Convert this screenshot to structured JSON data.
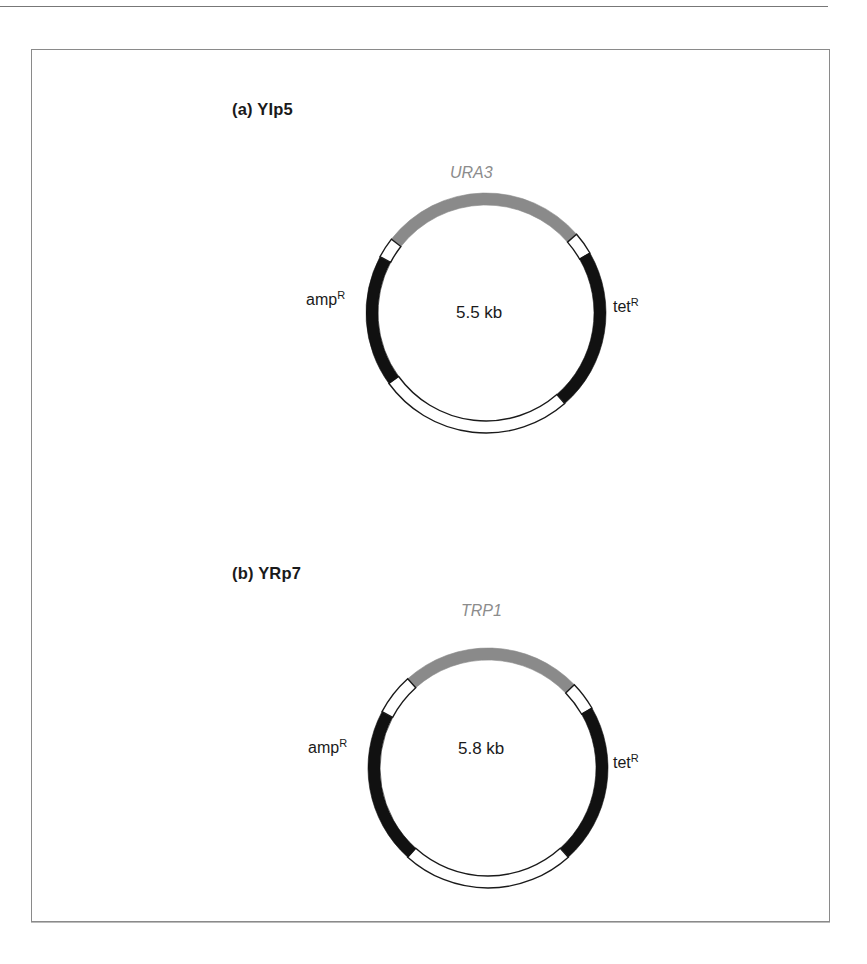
{
  "figure": {
    "panels": [
      {
        "id": "a",
        "title": "(a)  YIp5",
        "size_label": "5.5 kb",
        "marker_gene": "URA3",
        "left_label": {
          "base": "amp",
          "sup": "R"
        },
        "right_label": {
          "base": "tet",
          "sup": "R"
        },
        "segments": [
          {
            "name": "URA3",
            "start_deg": -52,
            "end_deg": 49,
            "fill": "#8a8a8a"
          },
          {
            "name": "spacer-1",
            "start_deg": 49,
            "end_deg": 60,
            "fill": "#ffffff"
          },
          {
            "name": "tetR",
            "start_deg": 60,
            "end_deg": 139,
            "fill": "#111111"
          },
          {
            "name": "spacer-2",
            "start_deg": 139,
            "end_deg": 234,
            "fill": "#ffffff"
          },
          {
            "name": "ampR",
            "start_deg": 234,
            "end_deg": 298,
            "fill": "#111111"
          },
          {
            "name": "spacer-3",
            "start_deg": 298,
            "end_deg": 308,
            "fill": "#ffffff"
          }
        ]
      },
      {
        "id": "b",
        "title": "(b)  YRp7",
        "size_label": "5.8 kb",
        "marker_gene": "TRP1",
        "left_label": {
          "base": "amp",
          "sup": "R"
        },
        "right_label": {
          "base": "tet",
          "sup": "R"
        },
        "segments": [
          {
            "name": "TRP1",
            "start_deg": -42,
            "end_deg": 46,
            "fill": "#8a8a8a"
          },
          {
            "name": "spacer-1",
            "start_deg": 46,
            "end_deg": 60,
            "fill": "#ffffff"
          },
          {
            "name": "tetR",
            "start_deg": 60,
            "end_deg": 138,
            "fill": "#111111"
          },
          {
            "name": "spacer-2",
            "start_deg": 138,
            "end_deg": 222,
            "fill": "#ffffff"
          },
          {
            "name": "ampR",
            "start_deg": 222,
            "end_deg": 298,
            "fill": "#111111"
          },
          {
            "name": "spacer-3",
            "start_deg": 298,
            "end_deg": 318,
            "fill": "#ffffff"
          }
        ]
      }
    ]
  }
}
